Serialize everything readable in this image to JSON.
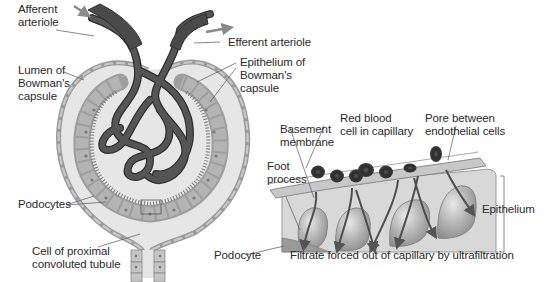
{
  "diagram": {
    "colors": {
      "vessel": "#4a4a4a",
      "vessel_outline": "#2e2e2e",
      "capsule_fill": "#e6e6e6",
      "capsule_outline": "#9a9a9a",
      "podocyte_fill": "#a8a8a8",
      "cell_nucleus": "#6e6e6e",
      "red_blood_cell": "#3c3c3c",
      "epithelium_fill": "#b9b9b9",
      "arrow": "#8a8a8a",
      "label_text": "#2a2a2a",
      "leader_line": "#555555"
    },
    "labels": {
      "afferent_arteriole": "Afferent\narteriole",
      "efferent_arteriole": "Efferent arteriole",
      "lumen_bowmans_capsule": "Lumen of\nBowman's\ncapsule",
      "epithelium_bowmans_capsule": "Epithelium of\nBowman's\ncapsule",
      "podocytes": "Podocytes",
      "cell_proximal_tubule": "Cell of proximal\nconvoluted tubule",
      "basement_membrane": "Basement\nmembrane",
      "red_blood_cell": "Red blood\ncell in capillary",
      "pore_endothelial": "Pore between\nendothelial cells",
      "foot_process": "Foot\nprocess",
      "epithelium": "Epithelium",
      "podocyte": "Podocyte",
      "filtrate_caption": "Filtrate forced out of capillary by ultrafiltration"
    }
  }
}
